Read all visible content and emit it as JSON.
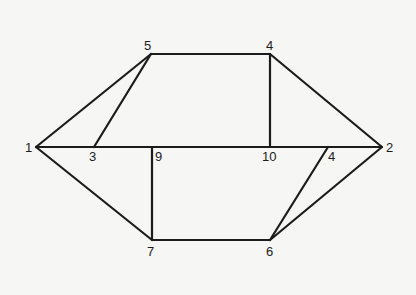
{
  "diagram": {
    "type": "graph",
    "nodes": [
      {
        "id": "n1",
        "label": "1",
        "x": 36,
        "y": 147,
        "lx": 25,
        "ly": 152
      },
      {
        "id": "n2",
        "label": "2",
        "x": 382,
        "y": 147,
        "lx": 386,
        "ly": 152
      },
      {
        "id": "n5",
        "label": "5",
        "x": 151,
        "y": 54,
        "lx": 144,
        "ly": 50
      },
      {
        "id": "n4top",
        "label": "4",
        "x": 270,
        "y": 54,
        "lx": 266,
        "ly": 50
      },
      {
        "id": "n3",
        "label": "3",
        "x": 94,
        "y": 147,
        "lx": 89,
        "ly": 161
      },
      {
        "id": "n9",
        "label": "9",
        "x": 152,
        "y": 147,
        "lx": 155,
        "ly": 161
      },
      {
        "id": "n10",
        "label": "10",
        "x": 270,
        "y": 147,
        "lx": 262,
        "ly": 161
      },
      {
        "id": "n4mid",
        "label": "4",
        "x": 328,
        "y": 147,
        "lx": 328,
        "ly": 161
      },
      {
        "id": "n7",
        "label": "7",
        "x": 152,
        "y": 240,
        "lx": 147,
        "ly": 256
      },
      {
        "id": "n6",
        "label": "6",
        "x": 270,
        "y": 240,
        "lx": 266,
        "ly": 256
      }
    ],
    "edges": [
      {
        "from": "n1",
        "to": "n5"
      },
      {
        "from": "n3",
        "to": "n5"
      },
      {
        "from": "n5",
        "to": "n4top"
      },
      {
        "from": "n4top",
        "to": "n2"
      },
      {
        "from": "n4top",
        "to": "n10"
      },
      {
        "from": "n1",
        "to": "n2"
      },
      {
        "from": "n9",
        "to": "n7"
      },
      {
        "from": "n1",
        "to": "n7"
      },
      {
        "from": "n7",
        "to": "n6"
      },
      {
        "from": "n6",
        "to": "n4mid"
      },
      {
        "from": "n6",
        "to": "n2"
      }
    ]
  }
}
